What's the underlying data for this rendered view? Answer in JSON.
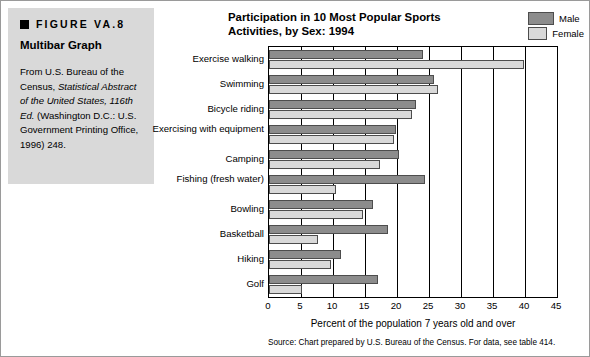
{
  "caption": {
    "figure_label": "FIGURE VA.8",
    "title": "Multibar Graph",
    "body_1": "From U.S. Bureau of the Census, ",
    "body_italic_1": "Statistical Abstract of the United States, 116th Ed.",
    "body_2": " (Washington D.C.: U.S. Government Printing Office, 1996) 248."
  },
  "legend": {
    "items": [
      {
        "label": "Male",
        "color": "#8c8c8c"
      },
      {
        "label": "Female",
        "color": "#d9d9d9"
      }
    ]
  },
  "axis": {
    "xlabel": "Percent of the population 7 years old and over",
    "source": "Source: Chart prepared by U.S. Bureau of the Census. For data, see table 414."
  },
  "chart_data": {
    "type": "bar",
    "orientation": "horizontal",
    "title": "Participation in 10 Most Popular Sports Activities, by Sex: 1994",
    "xlabel": "Percent of the population 7 years old and over",
    "ylabel": "",
    "xlim": [
      0,
      45
    ],
    "xticks": [
      0,
      5,
      10,
      15,
      20,
      25,
      30,
      35,
      40,
      45
    ],
    "grid": true,
    "legend_position": "top-right",
    "categories": [
      "Exercise walking",
      "Swimming",
      "Bicycle riding",
      "Exercising with equipment",
      "Camping",
      "Fishing (fresh water)",
      "Bowling",
      "Basketball",
      "Hiking",
      "Golf"
    ],
    "series": [
      {
        "name": "Male",
        "color": "#8c8c8c",
        "values": [
          24.0,
          25.8,
          23.0,
          19.8,
          20.3,
          24.4,
          16.2,
          18.6,
          11.3,
          17.0
        ]
      },
      {
        "name": "Female",
        "color": "#d9d9d9",
        "values": [
          39.8,
          26.4,
          22.3,
          19.5,
          17.4,
          10.5,
          14.7,
          7.6,
          9.7,
          5.2
        ]
      }
    ]
  }
}
